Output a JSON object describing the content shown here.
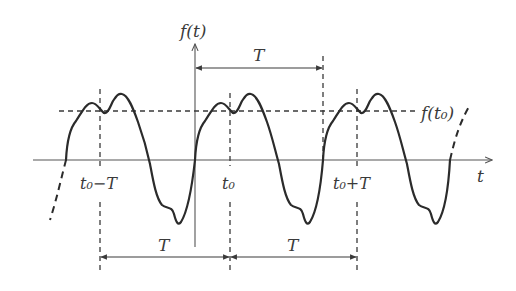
{
  "figure": {
    "axes": {
      "y_label": "f(t)",
      "x_label": "t"
    },
    "level_label": "f(t₀)",
    "markers": {
      "t0_minus_T": "t₀−T",
      "t0": "t₀",
      "t0_plus_T": "t₀+T"
    },
    "period_labels": {
      "top": "T",
      "bottom_left": "T",
      "bottom_right": "T"
    },
    "colors": {
      "curve": "#2b2b2b",
      "axes": "#555555",
      "dashed": "#3a3a3a",
      "background": "#ffffff"
    }
  }
}
